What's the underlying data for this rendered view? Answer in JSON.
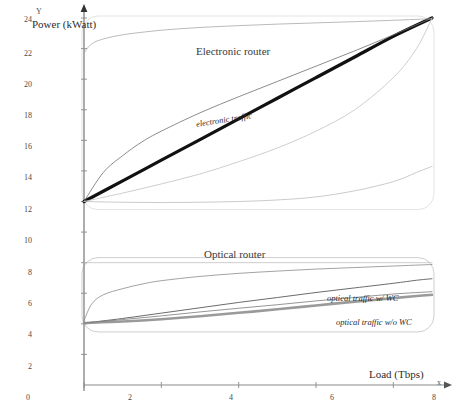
{
  "chart_data": {
    "type": "line",
    "title": "",
    "xlabel": "Load (Tbps)",
    "ylabel": "Power (kWatt)",
    "xlim": [
      0,
      9
    ],
    "ylim": [
      0,
      24
    ],
    "grid": false,
    "legend_position": "inline-annotations",
    "axis_letters": {
      "x": "x",
      "y": "Y"
    },
    "xticks": [
      0,
      2,
      4,
      6,
      8
    ],
    "yticks": [
      2,
      4,
      6,
      8,
      10,
      12,
      14,
      16,
      18,
      20,
      22,
      24
    ],
    "panel_titles": [
      {
        "text": "Electronic router",
        "x": 4.2,
        "y": 22.6
      },
      {
        "text": "Optical router",
        "x": 4.3,
        "y": 9.0
      }
    ],
    "annotations": [
      {
        "text": "electronic traffic",
        "x": 4.15,
        "y": 16.6
      },
      {
        "text": "optical traffic w/ WC",
        "x": 6.8,
        "y": 5.9
      },
      {
        "text": "optical traffic w/o WC",
        "x": 7.1,
        "y": 4.6
      }
    ],
    "series": [
      {
        "name": "electronic traffic",
        "color": "#111111",
        "width": 3.2,
        "points": [
          [
            0,
            12
          ],
          [
            1,
            13.35
          ],
          [
            2,
            14.7
          ],
          [
            3,
            16.05
          ],
          [
            4,
            17.4
          ],
          [
            5,
            18.75
          ],
          [
            6,
            20.1
          ],
          [
            7,
            21.45
          ],
          [
            8,
            22.8
          ],
          [
            9,
            24
          ]
        ]
      },
      {
        "name": "electronic upper bound",
        "color": "#6e6e6e",
        "width": 0.8,
        "points": [
          [
            0,
            12
          ],
          [
            0.5,
            13.9
          ],
          [
            1,
            15.0
          ],
          [
            1.5,
            15.9
          ],
          [
            2,
            16.6
          ],
          [
            3,
            17.8
          ],
          [
            4,
            18.85
          ],
          [
            5,
            19.85
          ],
          [
            6,
            20.85
          ],
          [
            7,
            21.85
          ],
          [
            8,
            22.9
          ],
          [
            9,
            24
          ]
        ]
      },
      {
        "name": "electronic lower bound",
        "color": "#c8c8c8",
        "width": 0.9,
        "points": [
          [
            0,
            12
          ],
          [
            1,
            12.55
          ],
          [
            2,
            13.15
          ],
          [
            3,
            13.8
          ],
          [
            4,
            14.6
          ],
          [
            5,
            15.5
          ],
          [
            6,
            16.6
          ],
          [
            7,
            18.0
          ],
          [
            8,
            20.1
          ],
          [
            8.6,
            22.0
          ],
          [
            9,
            24
          ]
        ]
      },
      {
        "name": "electronic idle ceiling",
        "color": "#a8a8a8",
        "width": 0.8,
        "points": [
          [
            0,
            21.7
          ],
          [
            0.15,
            22.2
          ],
          [
            0.4,
            22.55
          ],
          [
            1,
            22.9
          ],
          [
            2,
            23.2
          ],
          [
            3,
            23.38
          ],
          [
            4,
            23.5
          ],
          [
            5,
            23.6
          ],
          [
            6,
            23.68
          ],
          [
            7,
            23.76
          ],
          [
            8,
            23.85
          ],
          [
            9,
            23.95
          ]
        ]
      },
      {
        "name": "electronic idle floor",
        "color": "#bdbdbd",
        "width": 0.8,
        "points": [
          [
            0,
            12
          ],
          [
            1,
            11.95
          ],
          [
            2,
            11.93
          ],
          [
            3,
            11.95
          ],
          [
            4,
            12.0
          ],
          [
            5,
            12.1
          ],
          [
            6,
            12.3
          ],
          [
            7,
            12.7
          ],
          [
            8,
            13.3
          ],
          [
            8.6,
            13.9
          ],
          [
            9,
            14.3
          ]
        ]
      },
      {
        "name": "optical traffic w/ WC",
        "color": "#5a5a5a",
        "width": 0.9,
        "points": [
          [
            0,
            4.05
          ],
          [
            1,
            4.35
          ],
          [
            2,
            4.7
          ],
          [
            3,
            5.05
          ],
          [
            4,
            5.4
          ],
          [
            5,
            5.72
          ],
          [
            6,
            6.05
          ],
          [
            7,
            6.35
          ],
          [
            8,
            6.65
          ],
          [
            8.6,
            6.85
          ],
          [
            9,
            6.95
          ]
        ]
      },
      {
        "name": "optical traffic w/o WC",
        "color": "#9a9a9a",
        "width": 2.6,
        "points": [
          [
            0,
            4.05
          ],
          [
            1,
            4.15
          ],
          [
            2,
            4.3
          ],
          [
            3,
            4.5
          ],
          [
            4,
            4.72
          ],
          [
            5,
            4.95
          ],
          [
            6,
            5.2
          ],
          [
            7,
            5.45
          ],
          [
            8,
            5.68
          ],
          [
            8.6,
            5.82
          ],
          [
            9,
            5.9
          ]
        ]
      },
      {
        "name": "optical mid band",
        "color": "#7a7a7a",
        "width": 0.8,
        "points": [
          [
            0,
            4.05
          ],
          [
            1,
            4.28
          ],
          [
            2,
            4.52
          ],
          [
            3,
            4.78
          ],
          [
            4,
            5.02
          ],
          [
            5,
            5.25
          ],
          [
            6,
            5.5
          ],
          [
            7,
            5.72
          ],
          [
            8,
            5.95
          ],
          [
            9,
            6.1
          ]
        ]
      },
      {
        "name": "optical upper envelope",
        "color": "#8a8a8a",
        "width": 0.8,
        "points": [
          [
            0,
            4.2
          ],
          [
            0.2,
            5.3
          ],
          [
            0.5,
            5.9
          ],
          [
            1,
            6.3
          ],
          [
            1.5,
            6.6
          ],
          [
            2,
            6.82
          ],
          [
            3,
            7.1
          ],
          [
            4,
            7.3
          ],
          [
            5,
            7.45
          ],
          [
            6,
            7.58
          ],
          [
            7,
            7.68
          ],
          [
            8,
            7.78
          ],
          [
            9,
            7.88
          ]
        ]
      },
      {
        "name": "optical band ceiling",
        "color": "#c2c2c2",
        "width": 0.8,
        "points": [
          [
            0,
            8.0
          ],
          [
            2,
            8.0
          ],
          [
            4,
            8.0
          ],
          [
            6,
            8.0
          ],
          [
            8,
            8.0
          ],
          [
            9,
            8.0
          ]
        ]
      }
    ]
  },
  "labels": {
    "y_axis_letter": "Y",
    "x_axis_letter": "x",
    "power_caption": "Power (kWatt)",
    "load_caption": "Load (Tbps)",
    "electronic_router": "Electronic router",
    "optical_router": "Optical router",
    "electronic_traffic": "electronic traffic",
    "optical_wc": "optical traffic w/ WC",
    "optical_wo_wc": "optical traffic w/o WC",
    "y_ticks": [
      "24",
      "22",
      "20",
      "18",
      "16",
      "14",
      "12",
      "10",
      "8",
      "6",
      "4",
      "2"
    ],
    "x_ticks": [
      "0",
      "2",
      "4",
      "6",
      "8"
    ]
  },
  "colors": {
    "electronic_main": "#111111",
    "optical_wc": "#5a5a5a",
    "optical_wo_wc": "#9a9a9a",
    "axis": "#8a8a8a",
    "background": "#ffffff"
  }
}
